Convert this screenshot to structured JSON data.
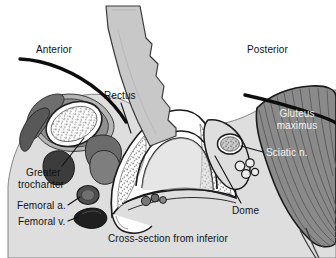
{
  "figure": {
    "caption": "Cross-section from inferior",
    "width": 336,
    "height": 258
  },
  "orientation_labels": {
    "anterior": "Anterior",
    "posterior": "Posterior"
  },
  "structure_labels": {
    "rectus": "Rectus",
    "greater_trochanter_line1": "Greater",
    "greater_trochanter_line2": "trochanter",
    "femoral_artery": "Femoral a.",
    "femoral_vein": "Femoral v.",
    "dome": "Dome",
    "gluteus_line1": "Gluteus",
    "gluteus_line2": "maximus",
    "sciatic_nerve": "Sciatic n."
  },
  "colors": {
    "background": "#ffffff",
    "soft_tissue": "#dedede",
    "skin_line": "#111111",
    "muscle_gluteus": "#8a8a8a",
    "muscle_striation": "#5f5f5f",
    "bone_cortex": "#ffffff",
    "bone_marrow_stipple": "#8e8e8e",
    "probe_body": "#c8c8c8",
    "vessel_artery": "#5a5a5a",
    "vessel_vein": "#2b2b2b",
    "muscle_dark": "#6a6a6a",
    "muscle_mid": "#9b9b9b",
    "nerve_fill": "#9a9a9a",
    "label_text": "#111111",
    "label_text_on_muscle": "#f2f2f2"
  },
  "icons": {
    "probe": "ultrasound-probe-icon",
    "leader_line": "leader-line-icon"
  }
}
